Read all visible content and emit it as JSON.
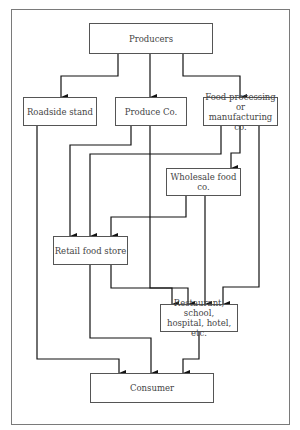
{
  "diagram": {
    "type": "flowchart",
    "title": "",
    "nodes": [
      {
        "id": "producers",
        "label": "Producers"
      },
      {
        "id": "roadside",
        "label": "Roadside stand"
      },
      {
        "id": "produce",
        "label": "Produce Co."
      },
      {
        "id": "foodproc",
        "label": "Food processing or\nmanufacturing co."
      },
      {
        "id": "wholesale",
        "label": "Wholesale food co."
      },
      {
        "id": "retail",
        "label": "Retail food store"
      },
      {
        "id": "restaurant",
        "label": "Restaurant, school,\nhospital, hotel, etc."
      },
      {
        "id": "consumer",
        "label": "Consumer"
      }
    ],
    "edges": [
      {
        "from": "producers",
        "to": "roadside"
      },
      {
        "from": "producers",
        "to": "produce"
      },
      {
        "from": "producers",
        "to": "foodproc"
      },
      {
        "from": "produce",
        "to": "retail"
      },
      {
        "from": "produce",
        "to": "restaurant"
      },
      {
        "from": "foodproc",
        "to": "retail"
      },
      {
        "from": "foodproc",
        "to": "wholesale"
      },
      {
        "from": "foodproc",
        "to": "restaurant"
      },
      {
        "from": "wholesale",
        "to": "retail"
      },
      {
        "from": "wholesale",
        "to": "restaurant"
      },
      {
        "from": "retail",
        "to": "consumer"
      },
      {
        "from": "retail",
        "to": "restaurant"
      },
      {
        "from": "roadside",
        "to": "consumer"
      },
      {
        "from": "restaurant",
        "to": "consumer"
      }
    ]
  },
  "colors": {
    "line": "#111111",
    "box_border": "#555555",
    "text": "#444444",
    "frame": "#7a7a7a"
  }
}
